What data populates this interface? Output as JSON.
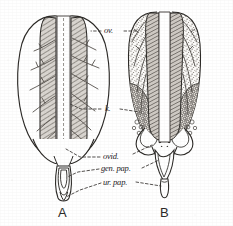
{
  "figure": {
    "type": "scientific-illustration",
    "background_color": "#ffffff",
    "ink_color": "#262422",
    "panels": [
      {
        "id": "A",
        "caption": "A",
        "description": "immature ovaries, smooth unstippled lobes with branching vessels and a shaded median band"
      },
      {
        "id": "B",
        "caption": "B",
        "description": "mature ovaries, heavily stippled lobes with dense granular follicles and outswept oviducts"
      }
    ],
    "labels": [
      {
        "id": "ov",
        "text": "ov.",
        "meaning": "ovary"
      },
      {
        "id": "k",
        "text": "k.",
        "meaning": "kidney"
      },
      {
        "id": "ovid",
        "text": "ovid.",
        "meaning": "oviduct"
      },
      {
        "id": "gen_pap",
        "text": "gen. pap.",
        "meaning": "genital papilla"
      },
      {
        "id": "ur_pap",
        "text": "ur. pap.",
        "meaning": "urinary papilla"
      }
    ]
  }
}
